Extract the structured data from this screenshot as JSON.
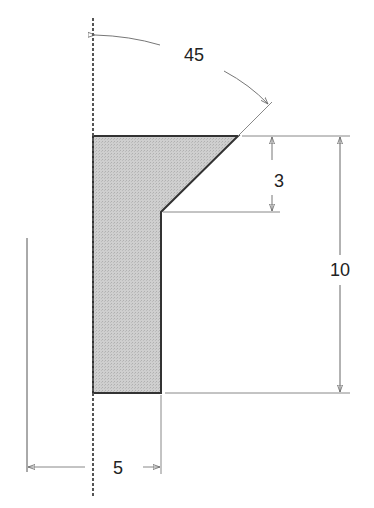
{
  "diagram": {
    "type": "technical-drawing",
    "dimensions": {
      "angle": "45",
      "chamfer_height": "3",
      "total_height": "10",
      "width": "5"
    },
    "colors": {
      "fill": "#c8c8c8",
      "outline": "#333333",
      "dim_line": "#777777"
    }
  }
}
